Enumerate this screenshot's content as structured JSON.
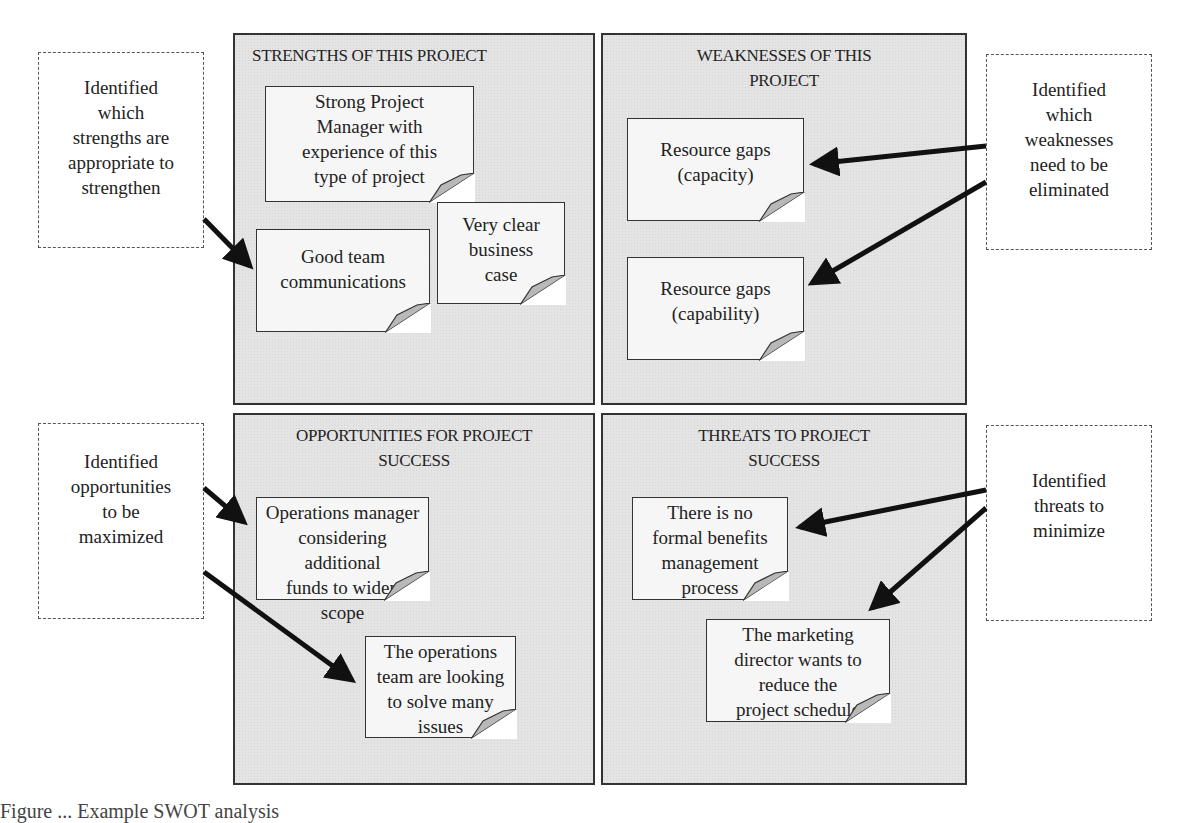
{
  "quadrants": {
    "strengths": {
      "title": "STRENGTHS OF THIS PROJECT",
      "notes": [
        "Strong Project\nManager with\nexperience of this\ntype of project",
        "Good team\ncommunications",
        "Very clear\nbusiness\ncase"
      ]
    },
    "weaknesses": {
      "title": "WEAKNESSES OF THIS\nPROJECT",
      "notes": [
        "Resource gaps\n(capacity)",
        "Resource gaps\n(capability)"
      ]
    },
    "opportunities": {
      "title": "OPPORTUNITIES FOR PROJECT\nSUCCESS",
      "notes": [
        "Operations manager\nconsidering additional\nfunds to widen scope",
        "The operations\nteam are looking\nto solve many\nissues"
      ]
    },
    "threats": {
      "title": "THREATS TO PROJECT\nSUCCESS",
      "notes": [
        "There is no\nformal benefits\nmanagement\nprocess",
        "The marketing\ndirector wants to\nreduce the\nproject schedule"
      ]
    }
  },
  "callouts": {
    "strengths": "Identified\nwhich\nstrengths are\nappropriate to\nstrengthen",
    "weaknesses": "Identified\nwhich\nweaknesses\nneed to be\neliminated",
    "opportunities": "Identified\nopportunities\nto be\nmaximized",
    "threats": "Identified\nthreats to\nminimize"
  },
  "caption": "Figure ... Example SWOT analysis",
  "colors": {
    "quadrant_fill": "#e4e4e4",
    "note_fill": "#f6f6f6",
    "fold_fill": "#b8b8b8",
    "arrow": "#111111",
    "border": "#333333"
  }
}
